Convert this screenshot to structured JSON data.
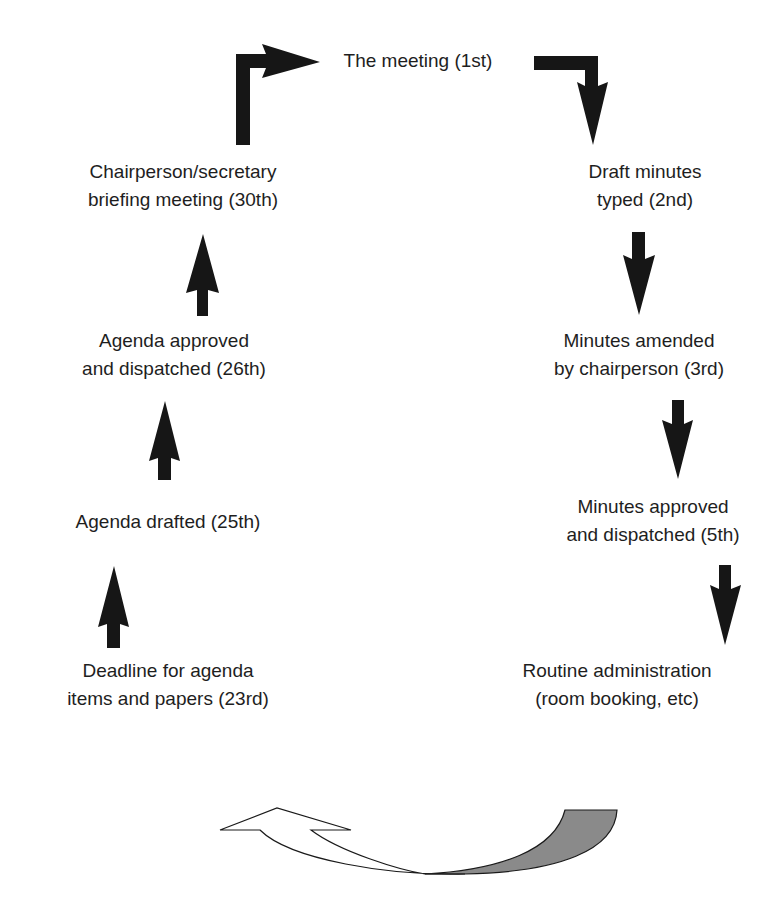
{
  "diagram": {
    "type": "cycle-flow",
    "colors": {
      "text": "#1e1e1e",
      "arrow": "#161616",
      "cycle_arrow_fill": "#8a8a8a",
      "background": "#ffffff"
    },
    "nodes": [
      {
        "id": "meeting",
        "lines": [
          "The meeting (1st)"
        ]
      },
      {
        "id": "draft-minutes",
        "lines": [
          "Draft minutes",
          "typed (2nd)"
        ]
      },
      {
        "id": "minutes-amended",
        "lines": [
          "Minutes amended",
          "by chairperson (3rd)"
        ]
      },
      {
        "id": "minutes-approved",
        "lines": [
          "Minutes approved",
          "and dispatched (5th)"
        ]
      },
      {
        "id": "routine-admin",
        "lines": [
          "Routine administration",
          "(room booking, etc)"
        ]
      },
      {
        "id": "deadline",
        "lines": [
          "Deadline for agenda",
          "items and papers (23rd)"
        ]
      },
      {
        "id": "agenda-drafted",
        "lines": [
          "Agenda drafted (25th)"
        ]
      },
      {
        "id": "agenda-approved",
        "lines": [
          "Agenda approved",
          "and dispatched (26th)"
        ]
      },
      {
        "id": "briefing",
        "lines": [
          "Chairperson/secretary",
          "briefing meeting (30th)"
        ]
      }
    ],
    "edges": [
      {
        "from": "meeting",
        "to": "draft-minutes",
        "style": "bent-down"
      },
      {
        "from": "draft-minutes",
        "to": "minutes-amended",
        "style": "down"
      },
      {
        "from": "minutes-amended",
        "to": "minutes-approved",
        "style": "down"
      },
      {
        "from": "minutes-approved",
        "to": "routine-admin",
        "style": "down"
      },
      {
        "from": "routine-admin",
        "to": "deadline",
        "style": "curved-cycle-arrow"
      },
      {
        "from": "deadline",
        "to": "agenda-drafted",
        "style": "up"
      },
      {
        "from": "agenda-drafted",
        "to": "agenda-approved",
        "style": "up"
      },
      {
        "from": "agenda-approved",
        "to": "briefing",
        "style": "up"
      },
      {
        "from": "briefing",
        "to": "meeting",
        "style": "bent-right"
      }
    ]
  }
}
